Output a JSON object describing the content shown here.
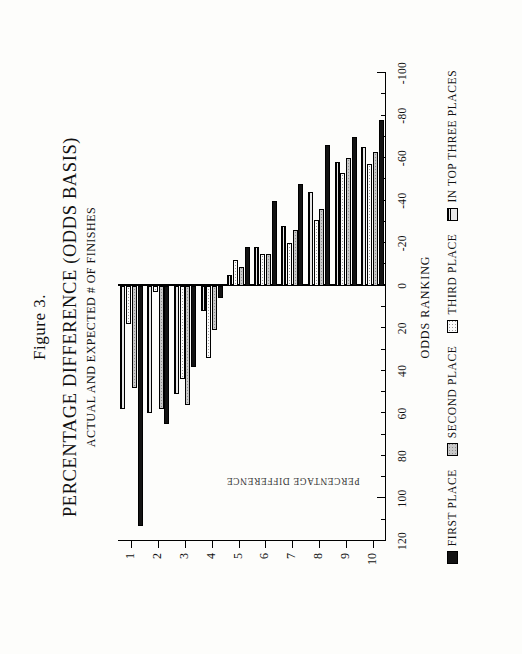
{
  "figure": {
    "label": "Figure 3.",
    "title": "PERCENTAGE DIFFERENCE (ODDS BASIS)",
    "subtitle": "ACTUAL AND EXPECTED # OF FINISHES"
  },
  "axes": {
    "x_title": "ODDS RANKING",
    "y_title": "PERCENTAGE DIFFERENCE",
    "y_ticklabels": [
      "120",
      "100",
      "80",
      "60",
      "40",
      "20",
      "0",
      "-20",
      "-40",
      "-60",
      "-80",
      "-100"
    ],
    "x_ticklabels": [
      "1",
      "2",
      "3",
      "4",
      "5",
      "6",
      "7",
      "8",
      "9",
      "10"
    ],
    "zero_label": "0"
  },
  "legend": {
    "items": [
      {
        "label": "FIRST PLACE",
        "swatch": "first-place-swatch",
        "color": "#131313"
      },
      {
        "label": "SECOND PLACE",
        "swatch": "second-place-swatch",
        "color": "#c8c8c8"
      },
      {
        "label": "THIRD PLACE",
        "swatch": "third-place-swatch",
        "color": "#fbfbfb"
      },
      {
        "label": "IN TOP THREE PLACES",
        "swatch": "in-top-three-swatch",
        "color": "#d8d8d8"
      }
    ]
  },
  "chart_data": {
    "type": "bar",
    "orientation": "horizontal",
    "title": "PERCENTAGE DIFFERENCE (ODDS BASIS)",
    "subtitle": "ACTUAL AND EXPECTED # OF FINISHES",
    "xlabel": "ODDS RANKING",
    "ylabel": "PERCENTAGE DIFFERENCE",
    "categories": [
      "1",
      "2",
      "3",
      "4",
      "5",
      "6",
      "7",
      "8",
      "9",
      "10"
    ],
    "ylim": [
      -100,
      120
    ],
    "ytick_step": 20,
    "minor_tick_step": 10,
    "grid": false,
    "legend_position": "bottom",
    "series": [
      {
        "name": "FIRST PLACE",
        "values": [
          113,
          65,
          38,
          6,
          -18,
          -40,
          -48,
          -66,
          -70,
          -78
        ]
      },
      {
        "name": "SECOND PLACE",
        "values": [
          48,
          58,
          56,
          21,
          -9,
          -15,
          -26,
          -36,
          -60,
          -63
        ]
      },
      {
        "name": "THIRD PLACE",
        "values": [
          18,
          3,
          44,
          34,
          -12,
          -15,
          -20,
          -31,
          -53,
          -57
        ]
      },
      {
        "name": "IN TOP THREE PLACES",
        "values": [
          58,
          60,
          51,
          12,
          -5,
          -18,
          -28,
          -44,
          -58,
          -65
        ]
      }
    ]
  }
}
